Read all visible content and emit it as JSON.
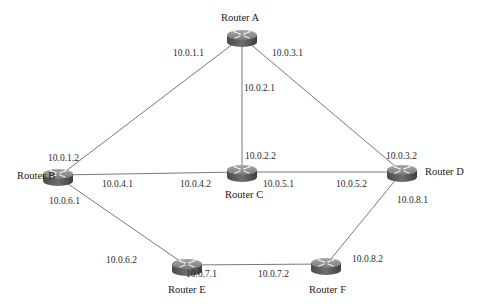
{
  "diagram": {
    "type": "network-topology",
    "routers": [
      {
        "id": "A",
        "name": "Router A",
        "x": 242,
        "y": 37
      },
      {
        "id": "B",
        "name": "Router B",
        "x": 58,
        "y": 177
      },
      {
        "id": "C",
        "name": "Router C",
        "x": 242,
        "y": 172
      },
      {
        "id": "D",
        "name": "Router D",
        "x": 402,
        "y": 172
      },
      {
        "id": "E",
        "name": "Router E",
        "x": 187,
        "y": 266
      },
      {
        "id": "F",
        "name": "Router F",
        "x": 326,
        "y": 265
      }
    ],
    "links": [
      {
        "from": "A",
        "to": "B",
        "from_ip": "10.0.1.1",
        "to_ip": "10.0.1.2"
      },
      {
        "from": "A",
        "to": "C",
        "from_ip": "10.0.2.1",
        "to_ip": "10.0.2.2"
      },
      {
        "from": "A",
        "to": "D",
        "from_ip": "10.0.3.1",
        "to_ip": "10.0.3.2"
      },
      {
        "from": "B",
        "to": "C",
        "from_ip": "10.0.4.1",
        "to_ip": "10.0.4.2"
      },
      {
        "from": "C",
        "to": "D",
        "from_ip": "10.0.5.1",
        "to_ip": "10.0.5.2"
      },
      {
        "from": "B",
        "to": "E",
        "from_ip": "10.0.6.1",
        "to_ip": "10.0.6.2"
      },
      {
        "from": "E",
        "to": "F",
        "from_ip": "10.0.7.1",
        "to_ip": "10.0.7.2"
      },
      {
        "from": "D",
        "to": "F",
        "from_ip": "10.0.8.1",
        "to_ip": "10.0.8.2"
      }
    ]
  },
  "labels": {
    "router_a": "Router A",
    "router_b": "Router B",
    "router_c": "Router C",
    "router_d": "Router D",
    "router_e": "Router E",
    "router_f": "Router F",
    "ip_a_b": "10.0.1.1",
    "ip_b_a": "10.0.1.2",
    "ip_a_c": "10.0.2.1",
    "ip_c_a": "10.0.2.2",
    "ip_a_d": "10.0.3.1",
    "ip_d_a": "10.0.3.2",
    "ip_b_c": "10.0.4.1",
    "ip_c_b": "10.0.4.2",
    "ip_c_d": "10.0.5.1",
    "ip_d_c": "10.0.5.2",
    "ip_b_e": "10.0.6.1",
    "ip_e_b": "10.0.6.2",
    "ip_e_f": "10.0.7.1",
    "ip_f_e": "10.0.7.2",
    "ip_d_f": "10.0.8.1",
    "ip_f_d": "10.0.8.2"
  },
  "colors": {
    "link": "#555555",
    "router_top": "#8a8a8a",
    "router_side": "#5a5a5a",
    "router_arrows": "#e6e6e6"
  }
}
